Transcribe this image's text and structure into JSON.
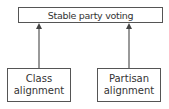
{
  "diagram": {
    "top_node": {
      "label": "Stable party voting"
    },
    "left_node": {
      "line1": "Class",
      "line2": "alignment"
    },
    "right_node": {
      "line1": "Partisan",
      "line2": "alignment"
    },
    "edges": [
      {
        "from": "left_node",
        "to": "top_node",
        "type": "arrow"
      },
      {
        "from": "right_node",
        "to": "top_node",
        "type": "arrow"
      }
    ],
    "colors": {
      "line": "#555555",
      "text": "#333333",
      "background": "#ffffff"
    }
  }
}
